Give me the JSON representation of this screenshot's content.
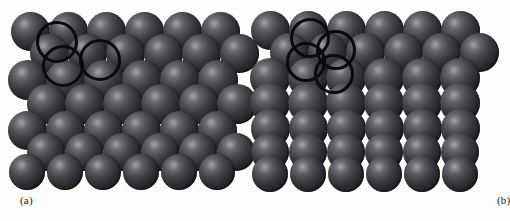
{
  "figure": {
    "background_color": "#fdfdfc",
    "sphere_color_light": "#8f8f92",
    "sphere_color_dark": "#0c0c0e",
    "ring_color": "#0a0a0c",
    "width": 496,
    "height": 221
  },
  "panels": [
    {
      "id": "a",
      "caption": "(a)",
      "description": "close-packed sphere stacking model",
      "sphere_radius": 19.5,
      "rings": [
        {
          "cx": 57,
          "cy": 42,
          "r": 21
        },
        {
          "cx": 63,
          "cy": 66,
          "r": 21
        },
        {
          "cx": 100,
          "cy": 60,
          "r": 21
        }
      ],
      "rows": [
        {
          "y": 31,
          "x_start": 30,
          "count": 6,
          "dx": 38,
          "z": 1,
          "scale": 1.0
        },
        {
          "y": 53,
          "x_start": 49,
          "count": 6,
          "dx": 38,
          "z": 2,
          "scale": 1.0
        },
        {
          "y": 80,
          "x_start": 28,
          "count": 6,
          "dx": 38,
          "z": 3,
          "scale": 1.03
        },
        {
          "y": 104,
          "x_start": 47,
          "count": 6,
          "dx": 38,
          "z": 4,
          "scale": 1.03
        },
        {
          "y": 130,
          "x_start": 27,
          "count": 6,
          "dx": 38,
          "z": 5,
          "scale": 1.0
        },
        {
          "y": 152,
          "x_start": 46,
          "count": 6,
          "dx": 38,
          "z": 6,
          "scale": 0.97
        },
        {
          "y": 172,
          "x_start": 27,
          "count": 6,
          "dx": 38,
          "z": 7,
          "scale": 0.93
        }
      ]
    },
    {
      "id": "b",
      "caption": "(b)",
      "description": "cubic close-packed sphere stacking model",
      "sphere_radius": 19.5,
      "rings": [
        {
          "cx": 62,
          "cy": 38,
          "r": 20
        },
        {
          "cx": 58,
          "cy": 62,
          "r": 20
        },
        {
          "cx": 88,
          "cy": 50,
          "r": 20
        },
        {
          "cx": 86,
          "cy": 74,
          "r": 20
        }
      ],
      "rows": [
        {
          "y": 30,
          "x_start": 22,
          "count": 6,
          "dx": 38,
          "z": 1,
          "scale": 1.0
        },
        {
          "y": 52,
          "x_start": 41,
          "count": 6,
          "dx": 38,
          "z": 2,
          "scale": 1.0
        },
        {
          "y": 78,
          "x_start": 22,
          "count": 6,
          "dx": 38,
          "z": 3,
          "scale": 1.03
        },
        {
          "y": 103,
          "x_start": 22,
          "count": 6,
          "dx": 38,
          "z": 4,
          "scale": 1.03
        },
        {
          "y": 128,
          "x_start": 22,
          "count": 6,
          "dx": 38,
          "z": 5,
          "scale": 1.0
        },
        {
          "y": 152,
          "x_start": 22,
          "count": 6,
          "dx": 38,
          "z": 6,
          "scale": 0.97
        },
        {
          "y": 174,
          "x_start": 22,
          "count": 6,
          "dx": 38,
          "z": 7,
          "scale": 0.93
        }
      ]
    }
  ]
}
